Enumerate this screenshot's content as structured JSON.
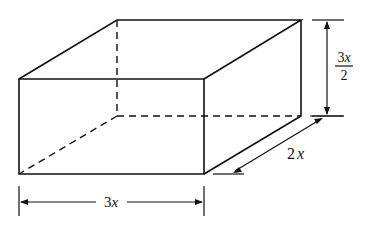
{
  "figure": {
    "colors": {
      "stroke": "#111111",
      "background": "#ffffff"
    },
    "dimensions": {
      "width": {
        "coef": "3",
        "var": "x",
        "label": "3x"
      },
      "depth": {
        "coef": "2",
        "var": "x",
        "label": "2x"
      },
      "height": {
        "numerator_coef": "3",
        "numerator_var": "x",
        "denominator": "2",
        "label": "3x/2"
      }
    }
  }
}
